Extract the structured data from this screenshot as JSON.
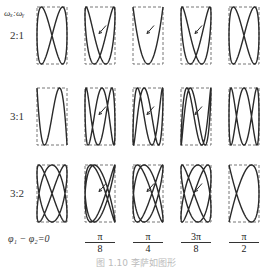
{
  "header": {
    "axis_label": "ωₓ:ωᵧ"
  },
  "rows": [
    {
      "label": "2:1",
      "wx": 2,
      "wy": 1,
      "top": 7
    },
    {
      "label": "3:1",
      "wx": 3,
      "wy": 1,
      "top": 88
    },
    {
      "label": "3:2",
      "wx": 3,
      "wy": 2,
      "top": 165
    }
  ],
  "phases": [
    {
      "label": "φ₁ − φ₂=0",
      "num": "",
      "den": "",
      "value": 0
    },
    {
      "label": "",
      "num": "π",
      "den": "8",
      "value": 0.392699
    },
    {
      "label": "",
      "num": "π",
      "den": "4",
      "value": 0.785398
    },
    {
      "label": "",
      "num": "3π",
      "den": "8",
      "value": 1.178097
    },
    {
      "label": "",
      "num": "π",
      "den": "2",
      "value": 1.570796
    }
  ],
  "phase_zero_label": "φ₁ − φ₂=0",
  "caption": "图 1.10   李萨如图形",
  "layout": {
    "col_centers": [
      52,
      100,
      148,
      196,
      244
    ],
    "box_w": 30,
    "box_h": 57
  },
  "colors": {
    "curve": "#2a2a2a",
    "box": "#666666"
  }
}
